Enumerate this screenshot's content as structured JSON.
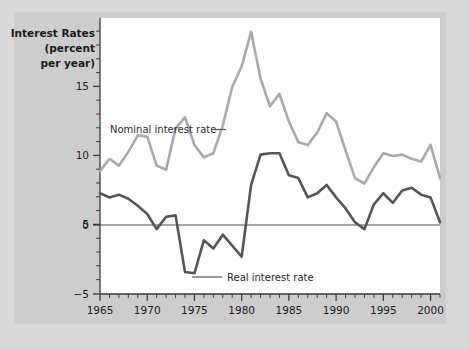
{
  "figure": {
    "background_color": "#d9d9d9",
    "panel_color": "#ffffff",
    "axis_color": "#3a3a3a"
  },
  "axis_title": {
    "line1": "Interest Rates",
    "line2": "(percent",
    "line3": "per year)"
  },
  "annotations": {
    "nominal": "Nominal interest rate",
    "nominal_dash": "—",
    "real": "Real interest rate"
  },
  "chart_data": {
    "type": "line",
    "title": "",
    "subtitle": "",
    "xlabel": "",
    "ylabel": "Interest Rates (percent per year)",
    "xlim": [
      1965,
      2001
    ],
    "ylim": [
      -5,
      15
    ],
    "yticks": [
      -5,
      0,
      5,
      10,
      15
    ],
    "ytick_labels": [
      "−5",
      "0",
      "5",
      "10",
      "15"
    ],
    "xticks": [
      1965,
      1970,
      1975,
      1980,
      1985,
      1990,
      1995,
      2000
    ],
    "xtick_labels": [
      "1965",
      "1970",
      "1975",
      "1980",
      "1985",
      "1990",
      "1995",
      "2000"
    ],
    "minor_xticks_interval": 1,
    "minor_yticks_interval": 1,
    "grid": false,
    "legend_position": "inline-annotation",
    "zero_line": 0,
    "x": [
      1965,
      1966,
      1967,
      1968,
      1969,
      1970,
      1971,
      1972,
      1973,
      1974,
      1975,
      1976,
      1977,
      1978,
      1979,
      1980,
      1981,
      1982,
      1983,
      1984,
      1985,
      1986,
      1987,
      1988,
      1989,
      1990,
      1991,
      1992,
      1993,
      1994,
      1995,
      1996,
      1997,
      1998,
      1999,
      2000,
      2001
    ],
    "series": [
      {
        "name": "Nominal interest rate",
        "color": "#a9a9a9",
        "values": [
          3.9,
          4.8,
          4.3,
          5.3,
          6.5,
          6.4,
          4.3,
          4.0,
          7.0,
          7.8,
          5.8,
          4.9,
          5.2,
          7.2,
          10.0,
          11.5,
          14.0,
          10.6,
          8.6,
          9.5,
          7.5,
          6.0,
          5.8,
          6.7,
          8.1,
          7.5,
          5.4,
          3.4,
          3.0,
          4.2,
          5.2,
          5.0,
          5.1,
          4.8,
          4.6,
          5.8,
          3.4
        ],
        "peak": {
          "x": 1981,
          "y": 14.0
        }
      },
      {
        "name": "Real interest rate",
        "color": "#555555",
        "values": [
          2.3,
          2.0,
          2.2,
          1.9,
          1.4,
          0.8,
          -0.3,
          0.6,
          0.7,
          -3.4,
          -3.5,
          -1.1,
          -1.7,
          -0.7,
          -1.5,
          -2.3,
          2.9,
          5.1,
          5.2,
          5.2,
          3.6,
          3.4,
          2.0,
          2.3,
          2.9,
          2.0,
          1.2,
          0.2,
          -0.3,
          1.5,
          2.3,
          1.6,
          2.5,
          2.7,
          2.2,
          2.0,
          0.2
        ],
        "trough": {
          "x": 1975,
          "y": -3.5
        }
      }
    ]
  }
}
